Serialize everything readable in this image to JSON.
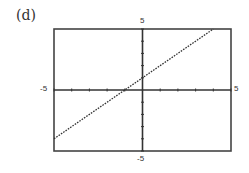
{
  "panel_label": "(d)",
  "chart_data": {
    "type": "line",
    "title": "",
    "xlabel": "",
    "ylabel": "",
    "xlim": [
      -5,
      5
    ],
    "ylim": [
      -5,
      5
    ],
    "grid": false,
    "tick_step": 1,
    "tick_labels": {
      "x_min": "-5",
      "x_max": "5",
      "y_min": "-5",
      "y_max": "5"
    },
    "series": [
      {
        "name": "y = x + 1",
        "equation": "y = x + 1",
        "style": "dotted",
        "x": [
          -5,
          -4,
          -3,
          -2,
          -1,
          0,
          1,
          2,
          3,
          4
        ],
        "y": [
          -4,
          -3,
          -2,
          -1,
          0,
          1,
          2,
          3,
          4,
          5
        ]
      }
    ]
  }
}
